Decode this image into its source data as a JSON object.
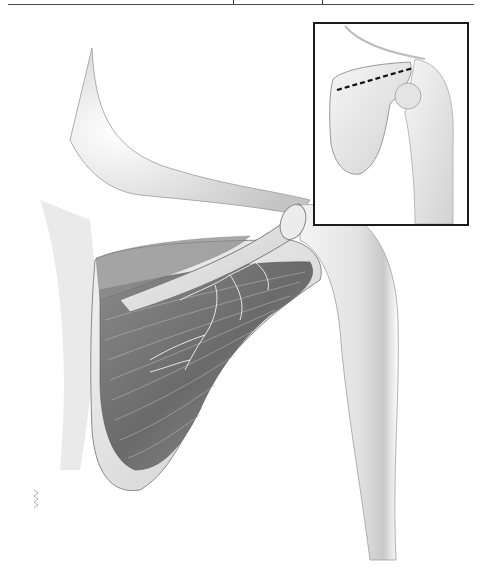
{
  "figure": {
    "main_view": "Posterior shoulder with scapula, muscle fibers and nerve branches",
    "inset_view": "Scapula and humerus with dashed line along scapular spine",
    "inset_line_style": "dashed"
  },
  "colors": {
    "background": "#ffffff",
    "rule": "#4a4a4a",
    "inset_border": "#1c1c1c",
    "muscle_dark": "#6e6e6e",
    "muscle_mid": "#9a9a9a",
    "bone_light": "#e6e6e6",
    "skin_shade": "#cfcfcf",
    "dashed_line": "#111111"
  }
}
